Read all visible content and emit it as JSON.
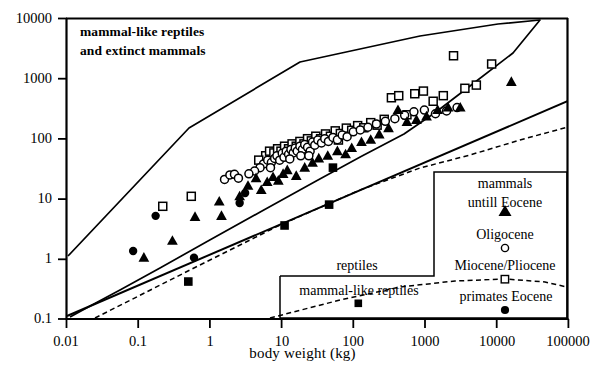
{
  "figure": {
    "annotation_line1": "mammal-like reptiles",
    "annotation_line2": "and extinct mammals"
  },
  "axes": {
    "x_title": "body weight (kg)",
    "x_ticklabels": [
      "0.01",
      "0.1",
      "1",
      "10",
      "100",
      "1000",
      "10000",
      "100000"
    ],
    "y_ticklabels": [
      "10000",
      "1000",
      "100",
      "10",
      "1",
      "0.1"
    ]
  },
  "legend": {
    "mammals_label_line1": "mammals",
    "mammals_label_line2": "untill Eocene",
    "oligocene_label": "Oligocene",
    "miopli_label": "Miocene/Pliocene",
    "primates_label": "primates Eocene",
    "reptiles_label": "reptiles",
    "mlr_label": "mammal-like reptiles"
  },
  "chart_data": {
    "type": "scatter",
    "title": "",
    "xlabel": "body weight (kg)",
    "ylabel": "",
    "xscale": "log",
    "yscale": "log",
    "xlim": [
      0.01,
      100000
    ],
    "ylim": [
      0.1,
      10000
    ],
    "xticks": [
      0.01,
      0.1,
      1,
      10,
      100,
      1000,
      10000,
      100000
    ],
    "yticks": [
      0.1,
      1,
      10,
      100,
      1000,
      10000
    ],
    "grid": false,
    "legend_position": "lower-right",
    "annotations": [
      {
        "text": "mammal-like reptiles and extinct mammals",
        "x": 0.035,
        "y": 4000
      }
    ],
    "series": [
      {
        "name": "mammals untill Eocene",
        "marker": "filled-triangle",
        "color": "#000000",
        "points": [
          [
            0.12,
            1.05
          ],
          [
            0.3,
            2.0
          ],
          [
            0.62,
            5.0
          ],
          [
            1.35,
            9.0
          ],
          [
            1.45,
            5.2
          ],
          [
            2.6,
            11.0
          ],
          [
            3.4,
            16.5
          ],
          [
            4.4,
            22.0
          ],
          [
            5.2,
            14.0
          ],
          [
            6.3,
            19.0
          ],
          [
            7.6,
            23.0
          ],
          [
            9.0,
            20.0
          ],
          [
            10.5,
            26.0
          ],
          [
            12.0,
            30.0
          ],
          [
            16.0,
            24.0
          ],
          [
            21.0,
            33.0
          ],
          [
            27.0,
            40.0
          ],
          [
            33.0,
            47.0
          ],
          [
            44.0,
            52.0
          ],
          [
            60.0,
            62.0
          ],
          [
            78.0,
            55.0
          ],
          [
            95.0,
            70.0
          ],
          [
            130.0,
            88.0
          ],
          [
            175.0,
            96.0
          ],
          [
            230.0,
            118.0
          ],
          [
            310.0,
            150.0
          ],
          [
            420.0,
            300.0
          ],
          [
            560.0,
            190.0
          ],
          [
            760.0,
            205.0
          ],
          [
            1050.0,
            235.0
          ],
          [
            1500.0,
            300.0
          ],
          [
            2100.0,
            330.0
          ],
          [
            3100.0,
            330.0
          ],
          [
            16000.0,
            880.0
          ]
        ]
      },
      {
        "name": "Oligocene",
        "marker": "open-circle",
        "color": "#000000",
        "points": [
          [
            1.6,
            21.0
          ],
          [
            1.9,
            25.0
          ],
          [
            2.2,
            25.5
          ],
          [
            2.5,
            22.0
          ],
          [
            5.6,
            38.0
          ],
          [
            6.4,
            44.0
          ],
          [
            7.2,
            40.0
          ],
          [
            8.0,
            47.0
          ],
          [
            8.6,
            52.0
          ],
          [
            9.4,
            44.0
          ],
          [
            10.2,
            57.0
          ],
          [
            10.8,
            49.0
          ],
          [
            11.6,
            62.0
          ],
          [
            12.5,
            55.0
          ],
          [
            13.5,
            66.0
          ],
          [
            14.5,
            58.0
          ],
          [
            15.5,
            70.0
          ],
          [
            16.5,
            62.0
          ],
          [
            18.0,
            75.0
          ],
          [
            19.5,
            66.0
          ],
          [
            21.0,
            80.0
          ],
          [
            23.0,
            72.0
          ],
          [
            25.0,
            62.0
          ],
          [
            27.0,
            88.0
          ],
          [
            29.0,
            78.0
          ],
          [
            32.0,
            95.0
          ],
          [
            36.0,
            85.0
          ],
          [
            40.0,
            100.0
          ],
          [
            45.0,
            90.0
          ],
          [
            52.0,
            105.0
          ],
          [
            60.0,
            96.0
          ],
          [
            70.0,
            115.0
          ],
          [
            82.0,
            108.0
          ],
          [
            100.0,
            130.0
          ],
          [
            125.0,
            140.0
          ],
          [
            160.0,
            155.0
          ],
          [
            210.0,
            175.0
          ],
          [
            280.0,
            195.0
          ],
          [
            380.0,
            215.0
          ],
          [
            520.0,
            245.0
          ],
          [
            700.0,
            280.0
          ],
          [
            980.0,
            300.0
          ],
          [
            1400.0,
            260.0
          ],
          [
            2000.0,
            290.0
          ],
          [
            2800.0,
            330.0
          ],
          [
            5.0,
            33.0
          ],
          [
            4.2,
            29.0
          ],
          [
            3.5,
            26.0
          ],
          [
            13.0,
            46.0
          ],
          [
            18.5,
            52.0
          ],
          [
            7.0,
            33.0
          ],
          [
            24.0,
            52.0
          ]
        ]
      },
      {
        "name": "Miocene/Pliocene",
        "marker": "open-square",
        "color": "#000000",
        "points": [
          [
            0.22,
            7.5
          ],
          [
            6.0,
            52.0
          ],
          [
            6.8,
            62.0
          ],
          [
            7.8,
            58.0
          ],
          [
            8.8,
            68.0
          ],
          [
            9.8,
            62.0
          ],
          [
            11.0,
            75.0
          ],
          [
            12.5,
            68.0
          ],
          [
            14.0,
            82.0
          ],
          [
            16.0,
            75.0
          ],
          [
            18.0,
            90.0
          ],
          [
            20.5,
            82.0
          ],
          [
            23.0,
            100.0
          ],
          [
            26.0,
            92.0
          ],
          [
            30.0,
            110.0
          ],
          [
            35.0,
            100.0
          ],
          [
            41.0,
            120.0
          ],
          [
            48.0,
            110.0
          ],
          [
            56.0,
            135.0
          ],
          [
            66.0,
            122.0
          ],
          [
            80.0,
            150.0
          ],
          [
            95.0,
            138.0
          ],
          [
            115.0,
            165.0
          ],
          [
            140.0,
            152.0
          ],
          [
            175.0,
            185.0
          ],
          [
            215.0,
            168.0
          ],
          [
            270.0,
            210.0
          ],
          [
            340.0,
            480.0
          ],
          [
            430.0,
            520.0
          ],
          [
            560.0,
            250.0
          ],
          [
            720.0,
            560.0
          ],
          [
            950.0,
            620.0
          ],
          [
            1300.0,
            420.0
          ],
          [
            1800.0,
            520.0
          ],
          [
            2500.0,
            2400.0
          ],
          [
            3600.0,
            690.0
          ],
          [
            5200.0,
            780.0
          ],
          [
            8500.0,
            1750.0
          ],
          [
            0.55,
            11.0
          ],
          [
            4.8,
            44.0
          ],
          [
            9.0,
            50.0
          ],
          [
            62.0,
            95.0
          ]
        ]
      },
      {
        "name": "primates Eocene",
        "marker": "filled-circle",
        "color": "#000000",
        "points": [
          [
            0.085,
            1.35
          ],
          [
            0.175,
            5.2
          ],
          [
            0.6,
            1.05
          ],
          [
            2.6,
            8.5
          ],
          [
            3.1,
            12.5
          ]
        ]
      },
      {
        "name": "reptiles / mammal-like reptiles",
        "marker": "filled-square",
        "color": "#000000",
        "points": [
          [
            0.5,
            0.42
          ],
          [
            11.0,
            3.6
          ],
          [
            46.0,
            8.0
          ],
          [
            52.0,
            33.0
          ]
        ]
      }
    ],
    "overlays": [
      {
        "name": "upper-envelope-polygon",
        "style": "solid",
        "description": "closed polygon enclosing mammal-like reptile and extinct mammal region"
      },
      {
        "name": "regression-line",
        "style": "solid",
        "description": "main allometric trend line"
      },
      {
        "name": "lower-boundary-line",
        "style": "dashed",
        "description": "dashed lower bounding trend"
      }
    ]
  }
}
